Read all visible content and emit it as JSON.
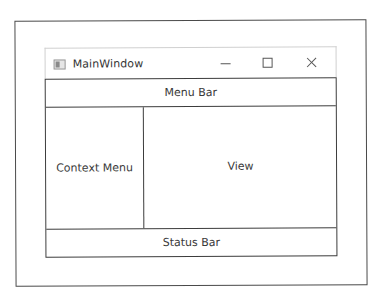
{
  "window": {
    "title": "MainWindow",
    "icon": "app-window-icon",
    "caption_buttons": {
      "minimize": "minimize-icon",
      "maximize": "maximize-icon",
      "close": "close-icon"
    }
  },
  "layout": {
    "menu_bar": "Menu Bar",
    "context_menu": "Context Menu",
    "view": "View",
    "status_bar": "Status Bar"
  },
  "colors": {
    "border_dark": "#3c3c3c",
    "titlebar_border": "#d0d0d0",
    "text": "#3a3a3a",
    "background": "#ffffff"
  }
}
